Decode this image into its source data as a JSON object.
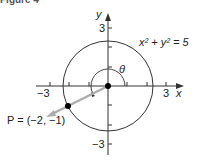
{
  "figure": {
    "caption": "Figure 4",
    "equation": "x² + y² = 5",
    "point_label": "P = (−2, −1)",
    "angle_label": "θ",
    "x_axis_label": "x",
    "y_axis_label": "y",
    "ticks": {
      "x_neg": "−3",
      "x_pos": "3",
      "y_pos": "3",
      "y_neg": "−3"
    },
    "colors": {
      "axis": "#333333",
      "circle": "#333333",
      "ray": "#aaaaaa",
      "point": "#000000"
    }
  }
}
